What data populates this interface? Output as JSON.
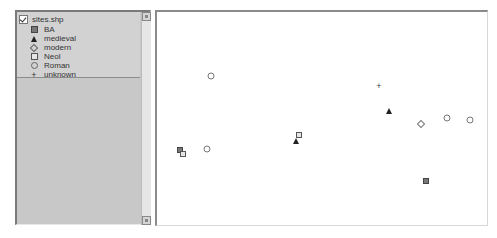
{
  "toc": {
    "layer": {
      "name": "sites.shp",
      "checked": true
    },
    "legend": [
      {
        "label": "BA",
        "symbol": "filled-square"
      },
      {
        "label": "medieval",
        "symbol": "filled-triangle"
      },
      {
        "label": "modern",
        "symbol": "diamond-outline"
      },
      {
        "label": "Neol",
        "symbol": "square-outline"
      },
      {
        "label": "Roman",
        "symbol": "circle-outline"
      },
      {
        "label": "unknown",
        "symbol": "plus"
      }
    ],
    "unknown_glyph": "+"
  },
  "map": {
    "points": [
      {
        "class": "Roman",
        "x": 54,
        "y": 64
      },
      {
        "class": "unknown",
        "x": 222,
        "y": 74
      },
      {
        "class": "medieval",
        "x": 232,
        "y": 99
      },
      {
        "class": "Roman",
        "x": 290,
        "y": 106
      },
      {
        "class": "Roman",
        "x": 313,
        "y": 108
      },
      {
        "class": "modern",
        "x": 264,
        "y": 112
      },
      {
        "class": "Neol",
        "x": 142,
        "y": 123
      },
      {
        "class": "medieval",
        "x": 139,
        "y": 129
      },
      {
        "class": "Roman",
        "x": 50,
        "y": 137
      },
      {
        "class": "BA",
        "x": 23,
        "y": 138
      },
      {
        "class": "Neol",
        "x": 26,
        "y": 142
      },
      {
        "class": "BA",
        "x": 269,
        "y": 169
      }
    ]
  }
}
